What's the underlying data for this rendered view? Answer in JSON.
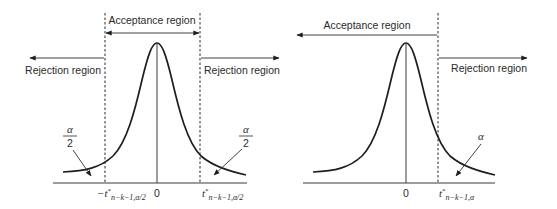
{
  "figure": {
    "colors": {
      "ink": "#1e1e1e",
      "background": "#ffffff"
    },
    "panels": [
      {
        "id": "two-tailed",
        "acceptance_label": "Acceptance region",
        "rejection_left_label": "Rejection region",
        "rejection_right_label": "Rejection region",
        "tail_left": {
          "numerator": "α",
          "denominator": "2"
        },
        "tail_right": {
          "numerator": "α",
          "denominator": "2"
        },
        "ticks": {
          "left_critical": {
            "prefix": "−t",
            "sup": "*",
            "sub": "n−k−1,α/2"
          },
          "center": "0",
          "right_critical": {
            "prefix": "t",
            "sup": "*",
            "sub": "n−k−1,α/2"
          }
        }
      },
      {
        "id": "one-tailed",
        "acceptance_label": "Acceptance region",
        "rejection_right_label": "Rejection region",
        "tail_right": {
          "symbol": "α"
        },
        "ticks": {
          "center": "0",
          "right_critical": {
            "prefix": "t",
            "sup": "*",
            "sub": "n−k−1,α"
          }
        }
      }
    ]
  }
}
